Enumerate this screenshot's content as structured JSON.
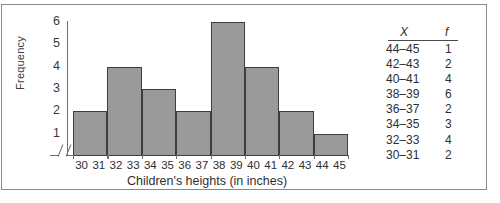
{
  "chart_data": {
    "type": "bar",
    "title": "",
    "xlabel": "Children's heights (in inches)",
    "ylabel": "Frequency",
    "categories": [
      "30-31",
      "32-33",
      "34-35",
      "36-37",
      "38-39",
      "40-41",
      "42-43",
      "44-45"
    ],
    "values": [
      2,
      4,
      3,
      2,
      6,
      4,
      2,
      1
    ],
    "ylim": [
      0,
      6
    ],
    "yticks": [
      1,
      2,
      3,
      4,
      5,
      6
    ],
    "ytick_labels": [
      "1",
      "2",
      "3",
      "4",
      "5",
      "6"
    ],
    "xtick_labels": [
      "30",
      "31",
      "32",
      "33",
      "34",
      "35",
      "36",
      "37",
      "38",
      "39",
      "40",
      "41",
      "42",
      "43",
      "44",
      "45"
    ],
    "grid": false,
    "legend": false,
    "axis_break": true,
    "bar_color": "#9a9a9a",
    "bar_edge_color": "#3d3d3d",
    "axis_color": "#6f6f6f"
  },
  "table": {
    "headers": {
      "x": "X",
      "f": "f"
    },
    "rows": [
      {
        "x": "44–45",
        "f": "1"
      },
      {
        "x": "42–43",
        "f": "2"
      },
      {
        "x": "40–41",
        "f": "4"
      },
      {
        "x": "38–39",
        "f": "6"
      },
      {
        "x": "36–37",
        "f": "2"
      },
      {
        "x": "34–35",
        "f": "3"
      },
      {
        "x": "32–33",
        "f": "4"
      },
      {
        "x": "30–31",
        "f": "2"
      }
    ]
  }
}
